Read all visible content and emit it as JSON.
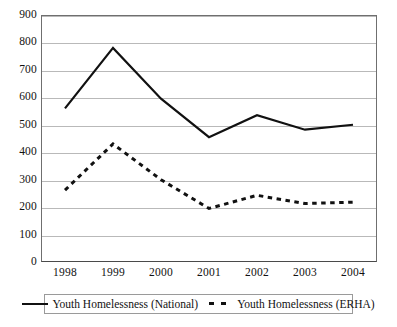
{
  "chart_data": {
    "type": "line",
    "title": "",
    "subtitle": "",
    "xlabel": "",
    "ylabel": "",
    "categories": [
      "1998",
      "1999",
      "2000",
      "2001",
      "2002",
      "2003",
      "2004"
    ],
    "x": [
      1998,
      1999,
      2000,
      2001,
      2002,
      2003,
      2004
    ],
    "series": [
      {
        "name": "Youth Homelessness (National)",
        "style": "solid",
        "color": "#111111",
        "values": [
          560,
          780,
          595,
          455,
          535,
          482,
          500
        ]
      },
      {
        "name": "Youth Homelessness (ERHA)",
        "style": "dotted",
        "color": "#111111",
        "values": [
          262,
          430,
          300,
          195,
          243,
          213,
          218
        ]
      }
    ],
    "ylim": [
      0,
      900
    ],
    "ytick_step": 100,
    "yticks": [
      "900",
      "800",
      "700",
      "600",
      "500",
      "400",
      "300",
      "200",
      "100",
      "0"
    ],
    "grid": "horizontal",
    "legend_position": "bottom",
    "legend": [
      {
        "label": "Youth Homelessness (National)",
        "style": "solid"
      },
      {
        "label": "Youth Homelessness (ERHA)",
        "style": "dotted"
      }
    ]
  },
  "colors": {
    "line": "#111111",
    "gridline": "#b9b9b9",
    "axis": "#6f6f6f",
    "background": "#ffffff"
  }
}
